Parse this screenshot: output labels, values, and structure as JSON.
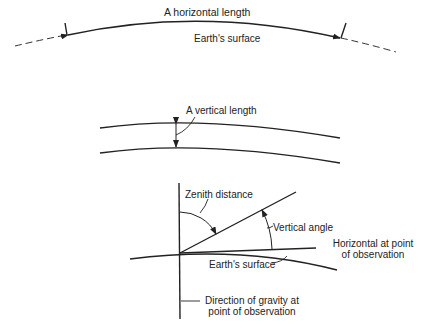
{
  "diagram": {
    "panels": [
      {
        "id": "horizontal-length",
        "labels": {
          "length": "A horizontal length",
          "surface": "Earth's surface"
        }
      },
      {
        "id": "vertical-length",
        "labels": {
          "length": "A vertical length"
        }
      },
      {
        "id": "angles",
        "labels": {
          "zenith": "Zenith distance",
          "vertical_angle": "Vertical angle",
          "horizontal_line1": "Horizontal at point",
          "horizontal_line2": "of observation",
          "surface": "Earth's surface",
          "gravity_line1": "Direction of gravity at",
          "gravity_line2": "point of observation"
        }
      }
    ],
    "colors": {
      "ink": "#222222",
      "background": "#ffffff"
    }
  }
}
